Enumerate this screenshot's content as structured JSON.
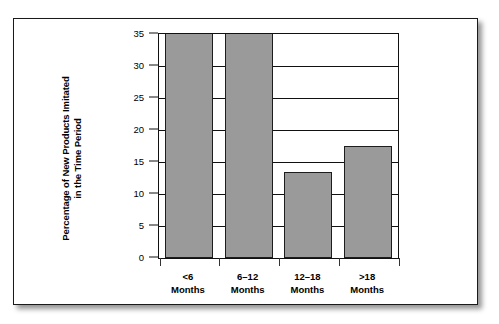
{
  "chart_data": {
    "type": "bar",
    "title": "",
    "subtitle": "",
    "xlabel": "",
    "ylabel": "Percentage of New Products Imitated in the Time Period",
    "ylabel_lines": [
      "Percentage of New Products Imitated",
      "in the Time Period"
    ],
    "categories": [
      "<6 Months",
      "6–12 Months",
      "12–18 Months",
      ">18 Months"
    ],
    "category_lines": [
      [
        "<6",
        "Months"
      ],
      [
        "6–12",
        "Months"
      ],
      [
        "12–18",
        "Months"
      ],
      [
        ">18",
        "Months"
      ]
    ],
    "values": [
      35,
      35,
      13.5,
      17.5
    ],
    "value_notes": [
      "clipped at axis maximum",
      "clipped at axis maximum",
      "",
      ""
    ],
    "ylim": [
      0,
      35
    ],
    "ytick_values": [
      0,
      5,
      10,
      15,
      20,
      25,
      30,
      35
    ],
    "ytick_labels": [
      "0",
      "5",
      "10",
      "15",
      "20",
      "25",
      "30",
      "35"
    ],
    "grid": "horizontal",
    "legend": "none",
    "bar_fill_color": "#9a9a9a",
    "bar_edge_color": "#1d1d1d",
    "axis_color": "#111111",
    "background_color": "#ffffff"
  }
}
